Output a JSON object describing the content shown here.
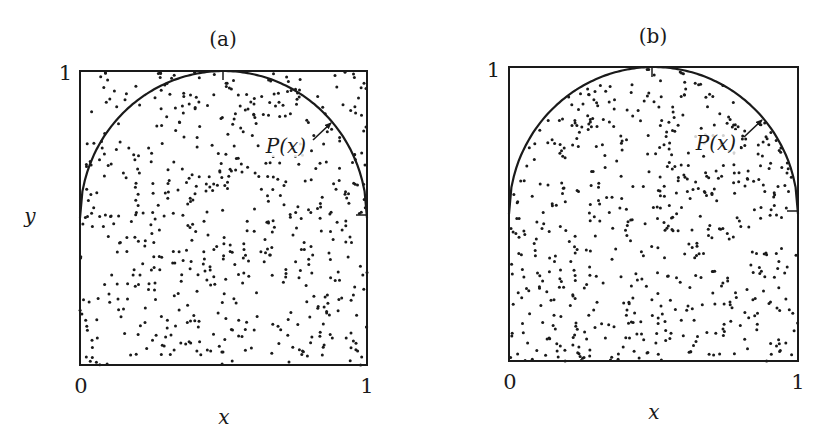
{
  "figure": {
    "y_axis_label": "y",
    "x_axis_label": "x"
  },
  "chart_data": [
    {
      "type": "scatter",
      "panel": "(a)",
      "title": "(a)",
      "xlabel": "x",
      "ylabel": "y",
      "xlim": [
        0,
        1
      ],
      "ylim": [
        0,
        1
      ],
      "x_ticks": [
        "0",
        "1"
      ],
      "y_ticks": [
        "1"
      ],
      "grid": false,
      "curve": {
        "label": "P(x)",
        "shape": "semicircle",
        "center": [
          0.5,
          0.5
        ],
        "radius": 0.5,
        "description": "upper half-circle from (0,0.5) through (0.5,1) to (1,0.5)"
      },
      "annotation": {
        "text": "P(x)",
        "arrow_to": [
          0.85,
          0.85
        ]
      },
      "points_description": "~600 uniformly random points filling the whole unit square, including outside the semicircle",
      "points_seed": 11,
      "points_count": 600
    },
    {
      "type": "scatter",
      "panel": "(b)",
      "title": "(b)",
      "xlabel": "x",
      "ylabel": "",
      "xlim": [
        0,
        1
      ],
      "ylim": [
        0,
        1
      ],
      "x_ticks": [
        "0",
        "1"
      ],
      "y_ticks": [
        "1"
      ],
      "grid": false,
      "curve": {
        "label": "P(x)",
        "shape": "semicircle",
        "center": [
          0.5,
          0.5
        ],
        "radius": 0.5,
        "description": "upper half-circle from (0,0.5) through (0.5,1) to (1,0.5)"
      },
      "annotation": {
        "text": "P(x)",
        "arrow_to": [
          0.85,
          0.85
        ]
      },
      "points_description": "~600 random points restricted to the region under P(x) (rejection sampling: only accepted points shown)",
      "points_seed": 29,
      "points_count": 600
    }
  ],
  "panels": {
    "a": {
      "title": "(a)",
      "tick_y1": "1",
      "tick_x0": "0",
      "tick_x1": "1",
      "curve_label": "P(x)",
      "x_label": "x",
      "y_label": "y"
    },
    "b": {
      "title": "(b)",
      "tick_y1": "1",
      "tick_x0": "0",
      "tick_x1": "1",
      "curve_label": "P(x)",
      "x_label": "x"
    }
  },
  "colors": {
    "ink": "#1a1a1a",
    "background": "#ffffff"
  }
}
